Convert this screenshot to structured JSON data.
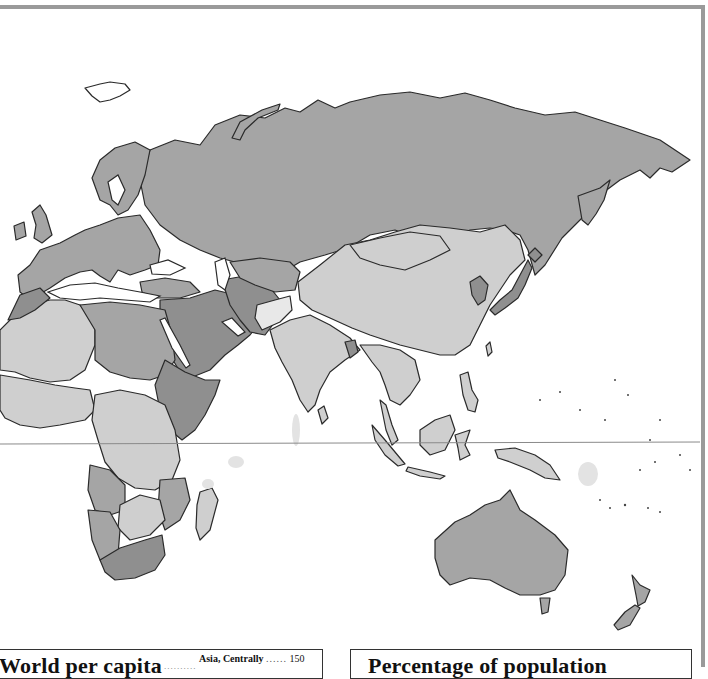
{
  "page": {
    "frame_color": "#9a9a9a",
    "background": "#ffffff"
  },
  "map": {
    "region": "Eastern Hemisphere (Europe, Africa, Asia, Oceania)",
    "shade_palette": {
      "darkest": "#8c8c8c",
      "dark": "#a3a3a3",
      "medium": "#b9b9b9",
      "light": "#cfcfcf",
      "lightest": "#e6e6e6",
      "water": "#ffffff",
      "border": "#2a2a2a"
    },
    "equator_line_color": "#8a8a8a"
  },
  "legends": {
    "left": {
      "title": "World per capita",
      "leader_dots": "..........",
      "entry_label": "Asia, Centrally",
      "entry_dots": "......",
      "entry_value": "150"
    },
    "right": {
      "title": "Percentage of population"
    }
  }
}
